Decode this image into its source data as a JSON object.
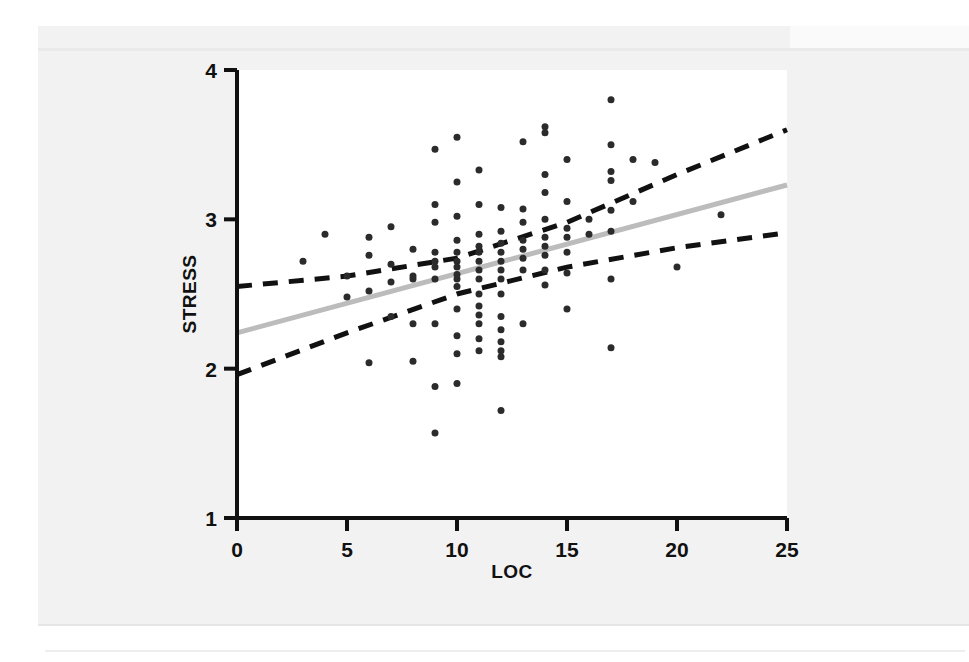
{
  "figure": {
    "background_color": "#f2f2f2",
    "plot_background_color": "#ffffff",
    "axis_color": "#111111"
  },
  "chart_data": {
    "type": "scatter",
    "title": "",
    "subtitle": "",
    "xlabel": "LOC",
    "ylabel": "STRESS",
    "xlim": [
      0,
      25
    ],
    "ylim": [
      1,
      4
    ],
    "xticks": [
      0,
      5,
      10,
      15,
      20,
      25
    ],
    "yticks": [
      1,
      2,
      3,
      4
    ],
    "xtick_labels": [
      "0",
      "5",
      "10",
      "15",
      "20",
      "25"
    ],
    "ytick_labels": [
      "1",
      "2",
      "3",
      "4"
    ],
    "grid": false,
    "legend": null,
    "legend_position": "none",
    "marker_color": "#2b2b2b",
    "marker_size_px": 7,
    "series": [
      {
        "name": "observations",
        "type": "scatter",
        "points": [
          [
            3,
            2.72
          ],
          [
            4,
            2.9
          ],
          [
            5,
            2.48
          ],
          [
            5,
            2.62
          ],
          [
            6,
            2.52
          ],
          [
            6,
            2.88
          ],
          [
            6,
            2.04
          ],
          [
            6,
            2.76
          ],
          [
            7,
            2.95
          ],
          [
            7,
            2.7
          ],
          [
            7,
            2.58
          ],
          [
            7,
            2.35
          ],
          [
            8,
            2.6
          ],
          [
            8,
            2.8
          ],
          [
            8,
            2.62
          ],
          [
            8,
            2.3
          ],
          [
            8,
            2.05
          ],
          [
            9,
            3.47
          ],
          [
            9,
            3.1
          ],
          [
            9,
            2.98
          ],
          [
            9,
            2.78
          ],
          [
            9,
            2.72
          ],
          [
            9,
            2.68
          ],
          [
            9,
            2.6
          ],
          [
            9,
            2.3
          ],
          [
            9,
            1.88
          ],
          [
            9,
            1.57
          ],
          [
            10,
            3.55
          ],
          [
            10,
            3.25
          ],
          [
            10,
            3.02
          ],
          [
            10,
            2.86
          ],
          [
            10,
            2.78
          ],
          [
            10,
            2.72
          ],
          [
            10,
            2.68
          ],
          [
            10,
            2.63
          ],
          [
            10,
            2.6
          ],
          [
            10,
            2.55
          ],
          [
            10,
            2.4
          ],
          [
            10,
            2.22
          ],
          [
            10,
            2.1
          ],
          [
            10,
            1.9
          ],
          [
            11,
            3.33
          ],
          [
            11,
            3.1
          ],
          [
            11,
            2.9
          ],
          [
            11,
            2.82
          ],
          [
            11,
            2.78
          ],
          [
            11,
            2.72
          ],
          [
            11,
            2.66
          ],
          [
            11,
            2.6
          ],
          [
            11,
            2.5
          ],
          [
            11,
            2.42
          ],
          [
            11,
            2.36
          ],
          [
            11,
            2.3
          ],
          [
            11,
            2.2
          ],
          [
            11,
            2.12
          ],
          [
            12,
            3.08
          ],
          [
            12,
            2.92
          ],
          [
            12,
            2.84
          ],
          [
            12,
            2.78
          ],
          [
            12,
            2.72
          ],
          [
            12,
            2.66
          ],
          [
            12,
            2.6
          ],
          [
            12,
            2.5
          ],
          [
            12,
            2.35
          ],
          [
            12,
            2.26
          ],
          [
            12,
            2.18
          ],
          [
            12,
            2.12
          ],
          [
            12,
            2.08
          ],
          [
            12,
            1.72
          ],
          [
            13,
            3.52
          ],
          [
            13,
            3.07
          ],
          [
            13,
            2.98
          ],
          [
            13,
            2.86
          ],
          [
            13,
            2.8
          ],
          [
            13,
            2.74
          ],
          [
            13,
            2.66
          ],
          [
            13,
            2.3
          ],
          [
            14,
            3.62
          ],
          [
            14,
            3.58
          ],
          [
            14,
            3.3
          ],
          [
            14,
            3.18
          ],
          [
            14,
            3.0
          ],
          [
            14,
            2.88
          ],
          [
            14,
            2.82
          ],
          [
            14,
            2.76
          ],
          [
            14,
            2.66
          ],
          [
            14,
            2.56
          ],
          [
            15,
            3.4
          ],
          [
            15,
            3.12
          ],
          [
            15,
            2.94
          ],
          [
            15,
            2.88
          ],
          [
            15,
            2.78
          ],
          [
            15,
            2.64
          ],
          [
            15,
            2.4
          ],
          [
            16,
            3.0
          ],
          [
            16,
            2.9
          ],
          [
            17,
            3.8
          ],
          [
            17,
            3.5
          ],
          [
            17,
            3.32
          ],
          [
            17,
            3.26
          ],
          [
            17,
            3.06
          ],
          [
            17,
            2.92
          ],
          [
            17,
            2.6
          ],
          [
            17,
            2.14
          ],
          [
            18,
            3.4
          ],
          [
            18,
            3.12
          ],
          [
            19,
            3.38
          ],
          [
            20,
            2.68
          ],
          [
            22,
            3.03
          ]
        ]
      }
    ],
    "fit_lines": [
      {
        "name": "regression-line",
        "style": "solid",
        "color": "#bcbcbc",
        "width_px": 5,
        "x": [
          0,
          25
        ],
        "y": [
          2.24,
          3.23
        ]
      },
      {
        "name": "upper-confidence-band",
        "style": "dashed",
        "color": "#111111",
        "width_px": 5,
        "x": [
          0,
          5,
          10,
          15,
          20,
          25
        ],
        "y": [
          2.55,
          2.62,
          2.74,
          2.98,
          3.3,
          3.6
        ]
      },
      {
        "name": "lower-confidence-band",
        "style": "dashed",
        "color": "#111111",
        "width_px": 5,
        "x": [
          0,
          5,
          10,
          15,
          20,
          25
        ],
        "y": [
          1.96,
          2.24,
          2.5,
          2.68,
          2.81,
          2.91
        ]
      }
    ]
  }
}
